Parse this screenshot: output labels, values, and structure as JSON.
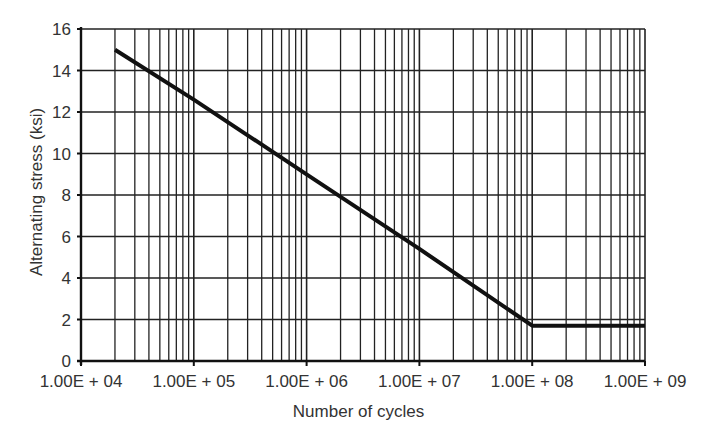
{
  "chart_data": {
    "type": "line",
    "title": "",
    "xlabel": "Number of cycles",
    "ylabel": "Alternating stress (ksi)",
    "x_scale": "log",
    "xlim": [
      10000,
      1000000000
    ],
    "ylim": [
      0,
      16
    ],
    "x_tick_labels": [
      "1.00E + 04",
      "1.00E + 05",
      "1.00E + 06",
      "1.00E + 07",
      "1.00E + 08",
      "1.00E + 09"
    ],
    "x_tick_values": [
      10000,
      100000,
      1000000,
      10000000,
      100000000,
      1000000000
    ],
    "y_tick_labels": [
      "0",
      "2",
      "4",
      "6",
      "8",
      "10",
      "12",
      "14",
      "16"
    ],
    "y_tick_values": [
      0,
      2,
      4,
      6,
      8,
      10,
      12,
      14,
      16
    ],
    "grid": true,
    "legend": null,
    "series": [
      {
        "name": "S-N curve",
        "x": [
          20000,
          100000,
          1000000,
          10000000,
          100000000,
          1000000000
        ],
        "y": [
          15.0,
          12.6,
          9.0,
          5.4,
          1.7,
          1.7
        ]
      }
    ]
  }
}
